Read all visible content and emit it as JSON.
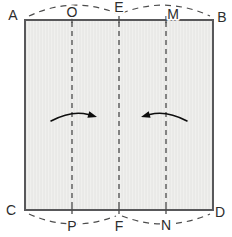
{
  "figure": {
    "colors": {
      "background": "#ffffff",
      "paper_fill": "#e9e9e7",
      "paper_stripe": "#f0f0ee",
      "paper_edge": "#58585a",
      "crease": "#4c4c4c",
      "arc": "#4c4c4c",
      "label": "#2d2d2d",
      "label_halo": "#ffffff",
      "arrow": "#0d0d0d"
    },
    "paper": {
      "x": 25,
      "y": 20,
      "width": 188,
      "height": 190
    },
    "creases": {
      "dash": "5,4",
      "stroke_width": 1.3,
      "y_inner_top": 22,
      "y_inner_bottom": 208,
      "tick_top": [
        16,
        23
      ],
      "tick_bottom": [
        207,
        214
      ],
      "items": [
        {
          "name": "crease-OP",
          "x": 72
        },
        {
          "name": "crease-EF",
          "x": 119
        },
        {
          "name": "crease-MN",
          "x": 166
        }
      ]
    },
    "arcs": {
      "dash": "6,5",
      "stroke_width": 1.2,
      "items": [
        {
          "name": "arc-A-to-E",
          "from": [
            29,
            16
          ],
          "ctrl": [
            72,
            -4
          ],
          "to": [
            116,
            13
          ]
        },
        {
          "name": "arc-E-to-B",
          "from": [
            122,
            13
          ],
          "ctrl": [
            166,
            -4
          ],
          "to": [
            210,
            16
          ]
        },
        {
          "name": "arc-C-to-F",
          "from": [
            29,
            214
          ],
          "ctrl": [
            72,
            233
          ],
          "to": [
            116,
            216
          ]
        },
        {
          "name": "arc-F-to-D",
          "from": [
            122,
            216
          ],
          "ctrl": [
            166,
            233
          ],
          "to": [
            210,
            214
          ]
        }
      ]
    },
    "arrows": {
      "stroke_width": 1.6,
      "head_length": 9,
      "head_half_width": 3.4,
      "items": [
        {
          "name": "fold-arrow-left",
          "direction": "right",
          "from": [
            51,
            121
          ],
          "ctrl": [
            72,
            110
          ],
          "to": [
            97,
            117
          ]
        },
        {
          "name": "fold-arrow-right",
          "direction": "left",
          "from": [
            187,
            121
          ],
          "ctrl": [
            166,
            110
          ],
          "to": [
            141,
            117
          ]
        }
      ]
    },
    "labels": {
      "font_size": 14,
      "items": [
        {
          "text": "A",
          "x": 13,
          "y": 15
        },
        {
          "text": "O",
          "x": 72,
          "y": 12
        },
        {
          "text": "E",
          "x": 119,
          "y": 7
        },
        {
          "text": "M",
          "x": 173,
          "y": 14
        },
        {
          "text": "B",
          "x": 222,
          "y": 17
        },
        {
          "text": "C",
          "x": 11,
          "y": 210
        },
        {
          "text": "P",
          "x": 72,
          "y": 226
        },
        {
          "text": "F",
          "x": 119,
          "y": 226
        },
        {
          "text": "N",
          "x": 166,
          "y": 225
        },
        {
          "text": "D",
          "x": 220,
          "y": 212
        }
      ]
    }
  }
}
